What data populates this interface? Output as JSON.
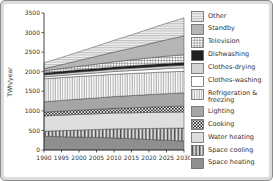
{
  "figure": {
    "background_color": "#ffffff",
    "frame_color": "#8a8a8a",
    "axis_color": "#333333",
    "band_outline_color": "#3a3a3a"
  },
  "chart_data": {
    "type": "area",
    "stacked": true,
    "title": "",
    "xlabel": "",
    "ylabel": "TWh/year",
    "x": [
      1990,
      1995,
      2000,
      2005,
      2010,
      2015,
      2020,
      2025,
      2030
    ],
    "xtick_labels": [
      "1990",
      "1995",
      "2000",
      "2005",
      "2010",
      "2015",
      "2020",
      "2025",
      "2030"
    ],
    "ylim": [
      0,
      3500
    ],
    "yticks": [
      0,
      500,
      1000,
      1500,
      2000,
      2500,
      3000,
      3500
    ],
    "grid": false,
    "legend_position": "right",
    "legend_order_note": "legend lists series top-of-stack first",
    "series": [
      {
        "name": "Space heating",
        "style": "solid",
        "color": "#8f8f8f",
        "values": [
          350,
          340,
          330,
          320,
          310,
          290,
          270,
          250,
          230
        ]
      },
      {
        "name": "Space cooling",
        "style": "vbars",
        "color": "#4a4a4a",
        "values": [
          130,
          155,
          180,
          205,
          230,
          255,
          280,
          305,
          330
        ]
      },
      {
        "name": "Water heating",
        "style": "solid",
        "color": "#dedede",
        "values": [
          390,
          395,
          400,
          400,
          405,
          405,
          410,
          410,
          410
        ]
      },
      {
        "name": "Cooking",
        "style": "checker",
        "color": "#1f1f1f",
        "values": [
          100,
          105,
          110,
          115,
          120,
          130,
          135,
          145,
          150
        ]
      },
      {
        "name": "Lighting",
        "style": "solid",
        "color": "#a6a6a6",
        "values": [
          260,
          270,
          280,
          290,
          300,
          310,
          320,
          330,
          340
        ]
      },
      {
        "name": "Refrigeration & freezing",
        "style": "vlines",
        "color": "#666666",
        "values": [
          590,
          585,
          580,
          575,
          570,
          565,
          560,
          555,
          550
        ]
      },
      {
        "name": "Clothes-washing",
        "style": "solid",
        "color": "#ffffff",
        "values": [
          50,
          55,
          60,
          65,
          70,
          75,
          80,
          85,
          90
        ]
      },
      {
        "name": "Clothes-drying",
        "style": "solid",
        "color": "#d4d4d4",
        "values": [
          50,
          52,
          54,
          56,
          58,
          60,
          62,
          64,
          65
        ]
      },
      {
        "name": "Dishwashing",
        "style": "solid",
        "color": "#1f1f1f",
        "values": [
          50,
          52,
          55,
          58,
          60,
          62,
          65,
          68,
          70
        ]
      },
      {
        "name": "Television",
        "style": "grid",
        "color": "#666666",
        "values": [
          55,
          70,
          90,
          110,
          130,
          150,
          170,
          185,
          200
        ]
      },
      {
        "name": "Standby",
        "style": "solid",
        "color": "#b5b5b5",
        "values": [
          55,
          100,
          150,
          200,
          250,
          300,
          360,
          420,
          480
        ]
      },
      {
        "name": "Other",
        "style": "hlines",
        "color": "#8a8a8a",
        "values": [
          150,
          185,
          220,
          260,
          300,
          340,
          380,
          420,
          460
        ]
      }
    ]
  }
}
